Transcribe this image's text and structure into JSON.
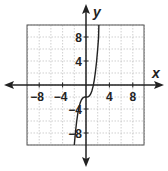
{
  "chart_data": {
    "type": "line",
    "title": "",
    "xlabel": "x",
    "ylabel": "y",
    "xlim": [
      -10,
      10
    ],
    "ylim": [
      -10,
      10
    ],
    "grid": true,
    "grid_step": 2,
    "x_ticks": [
      "-8",
      "-4",
      "4",
      "8"
    ],
    "y_ticks": [
      "8",
      "4",
      "-4",
      "-8"
    ],
    "x_tick_values": [
      -8,
      -4,
      4,
      8
    ],
    "y_tick_values": [
      8,
      4,
      -4,
      -8
    ],
    "series": [
      {
        "name": "f(x)",
        "description": "cubic-shaped curve, flat near (0,-2), steep rise to the right and steep drop to the left",
        "x": [
          -2.0,
          -1.8,
          -1.6,
          -1.4,
          -1.2,
          -1.0,
          -0.8,
          -0.6,
          -0.4,
          -0.2,
          0.0,
          0.2,
          0.4,
          0.6,
          0.8,
          1.0,
          1.2,
          1.4,
          1.6,
          1.8,
          2.0,
          2.15
        ],
        "y": [
          -10.0,
          -7.83,
          -6.1,
          -4.74,
          -3.73,
          -3.0,
          -2.51,
          -2.22,
          -2.06,
          -2.01,
          -2.0,
          -1.99,
          -1.94,
          -1.78,
          -1.49,
          -1.0,
          -0.27,
          0.74,
          2.1,
          3.83,
          6.0,
          7.94
        ]
      }
    ]
  },
  "axes": {
    "x_label": "x",
    "y_label": "y"
  }
}
